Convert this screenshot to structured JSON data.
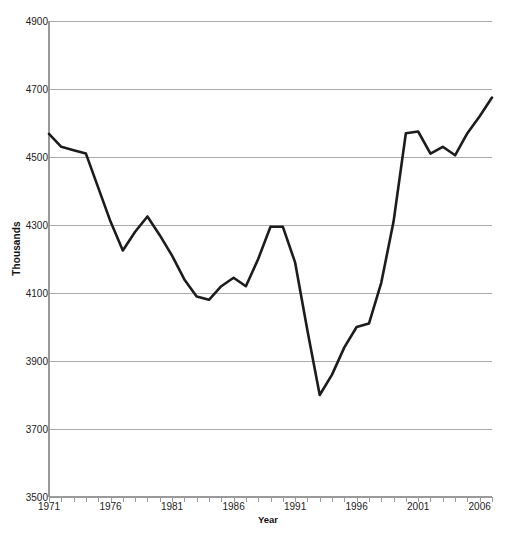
{
  "chart_data": {
    "type": "line",
    "title": "",
    "xlabel": "Year",
    "ylabel": "Thousands",
    "xlim": [
      1971,
      2007
    ],
    "ylim": [
      3500,
      4900
    ],
    "grid": true,
    "legend": false,
    "legend_position": "none",
    "series_color": "#1c1c1c",
    "gridline_color": "#aaaaaa",
    "axis_color": "#9a9a9a",
    "ytick_labels": [
      "3500",
      "3700",
      "3900",
      "4100",
      "4300",
      "4500",
      "4700",
      "4900"
    ],
    "ytick_values": [
      3500,
      3700,
      3900,
      4100,
      4300,
      4500,
      4700,
      4900
    ],
    "xtick_labels": [
      "1971",
      "1976",
      "1981",
      "1986",
      "1991",
      "1996",
      "2001",
      "2006"
    ],
    "xtick_values": [
      1971,
      1976,
      1981,
      1986,
      1991,
      1996,
      2001,
      2006
    ],
    "x": [
      1971,
      1972,
      1973,
      1974,
      1975,
      1976,
      1977,
      1978,
      1979,
      1980,
      1981,
      1982,
      1983,
      1984,
      1985,
      1986,
      1987,
      1988,
      1989,
      1990,
      1991,
      1992,
      1993,
      1994,
      1995,
      1996,
      1997,
      1998,
      1999,
      2000,
      2001,
      2002,
      2003,
      2004,
      2005,
      2006,
      2007
    ],
    "series": [
      {
        "name": "Thousands",
        "values": [
          4568,
          4530,
          4520,
          4510,
          4410,
          4310,
          4225,
          4280,
          4325,
          4270,
          4210,
          4140,
          4090,
          4080,
          4120,
          4145,
          4120,
          4200,
          4295,
          4295,
          4190,
          3990,
          3800,
          3860,
          3940,
          4000,
          4010,
          4130,
          4310,
          4570,
          4575,
          4510,
          4530,
          4505,
          4570,
          4620,
          4675
        ]
      }
    ]
  }
}
